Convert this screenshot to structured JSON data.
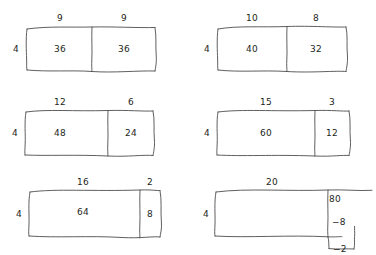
{
  "figure": {
    "style": "hand-drawn sketch",
    "stroke_color": "#4d4d4d",
    "text_color": "#231f20",
    "background_color": "#ffffff",
    "columns": 2,
    "rows": 3
  },
  "panels": [
    {
      "id": "panel-1",
      "left_factor": "4",
      "top_labels": [
        "9",
        "9"
      ],
      "cells": [
        "36",
        "36"
      ],
      "split_fraction": 0.5
    },
    {
      "id": "panel-2",
      "left_factor": "4",
      "top_labels": [
        "10",
        "8"
      ],
      "cells": [
        "40",
        "32"
      ],
      "split_fraction": 0.5555
    },
    {
      "id": "panel-3",
      "left_factor": "4",
      "top_labels": [
        "12",
        "6"
      ],
      "cells": [
        "48",
        "24"
      ],
      "split_fraction": 0.6667
    },
    {
      "id": "panel-4",
      "left_factor": "4",
      "top_labels": [
        "15",
        "3"
      ],
      "cells": [
        "60",
        "12"
      ],
      "split_fraction": 0.8333
    },
    {
      "id": "panel-5",
      "left_factor": "4",
      "top_labels": [
        "16",
        "2"
      ],
      "cells": [
        "64",
        "8"
      ],
      "split_fraction": 0.8889
    },
    {
      "id": "panel-6",
      "left_factor": "4",
      "top_labels": [
        "20"
      ],
      "cells": [
        ""
      ],
      "split_fraction": 1.0,
      "right_annotations": {
        "product": "80",
        "minus_eight": "−8",
        "minus_two": "−2"
      }
    }
  ]
}
